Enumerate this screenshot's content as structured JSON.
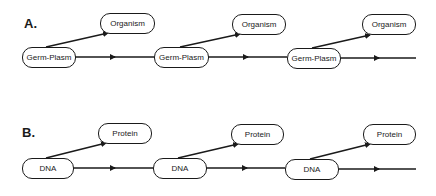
{
  "diagram": {
    "panels": [
      {
        "label": "A.",
        "lineage_node": "Germ-Plasm",
        "product_node": "Organism",
        "lineage_nodes": [
          "Germ-Plasm",
          "Germ-Plasm",
          "Germ-Plasm"
        ],
        "product_nodes": [
          "Organism",
          "Organism",
          "Organism"
        ]
      },
      {
        "label": "B.",
        "lineage_node": "DNA",
        "product_node": "Protein",
        "lineage_nodes": [
          "DNA",
          "DNA",
          "DNA"
        ],
        "product_nodes": [
          "Protein",
          "Protein",
          "Protein"
        ]
      }
    ],
    "colors": {
      "stroke": "#1a1a1a",
      "background": "#ffffff"
    }
  }
}
